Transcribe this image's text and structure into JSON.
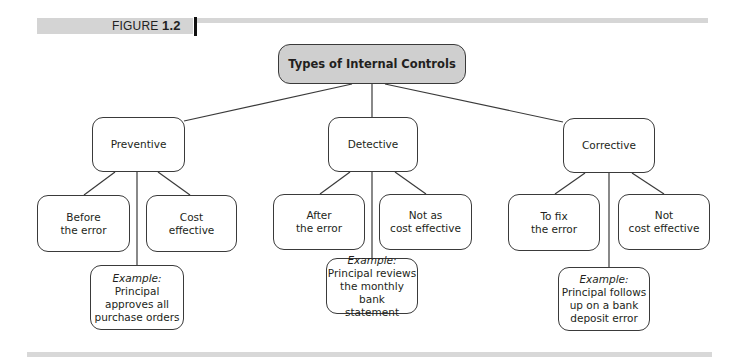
{
  "figure": {
    "label_prefix": "FIGURE",
    "label_number": "1.2"
  },
  "diagram": {
    "root": "Types of Internal Controls",
    "branches": [
      {
        "name": "Preventive",
        "children": [
          {
            "line1": "Before",
            "line2": "the error"
          },
          {
            "line1": "Cost",
            "line2": "effective"
          }
        ],
        "example": {
          "heading": "Example:",
          "lines": [
            "Principal",
            "approves all",
            "purchase orders"
          ]
        }
      },
      {
        "name": "Detective",
        "children": [
          {
            "line1": "After",
            "line2": "the error"
          },
          {
            "line1": "Not as",
            "line2": "cost effective"
          }
        ],
        "example": {
          "heading": "Example:",
          "lines": [
            "Principal reviews",
            "the monthly bank",
            "statement"
          ]
        }
      },
      {
        "name": "Corrective",
        "children": [
          {
            "line1": "To fix",
            "line2": "the error"
          },
          {
            "line1": "Not",
            "line2": "cost effective"
          }
        ],
        "example": {
          "heading": "Example:",
          "lines": [
            "Principal follows",
            "up on a bank",
            "deposit error"
          ]
        }
      }
    ]
  },
  "colors": {
    "root_fill": "#cfcfcf",
    "band_gray": "#d4d4d4",
    "line": "#3a3a3a"
  }
}
